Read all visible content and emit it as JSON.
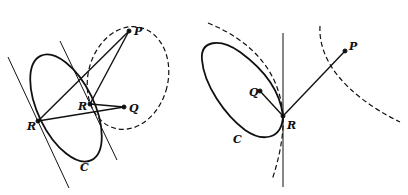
{
  "figure": {
    "left_panel": {
      "labels": {
        "P": "P",
        "Q": "Q",
        "R_inner": "R",
        "R_outer": "R",
        "C": "C"
      }
    },
    "right_panel": {
      "labels": {
        "P": "P",
        "Q": "Q",
        "R": "R",
        "C": "C"
      }
    },
    "colors": {
      "stroke": "#111111",
      "background": "#ffffff"
    }
  }
}
